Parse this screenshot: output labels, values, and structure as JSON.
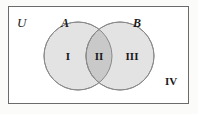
{
  "figure": {
    "type": "venn-diagram",
    "sets": 2,
    "background_color": "#fbfbfa",
    "universe": {
      "label": "U",
      "border_color": "#6b6b6b",
      "fill_color": "#ffffff"
    },
    "circles": [
      {
        "label": "A",
        "name": "set-a",
        "fill_color": "#e3e3e3",
        "stroke_color": "#8a8a8a"
      },
      {
        "label": "B",
        "name": "set-b",
        "fill_color": "#e3e3e3",
        "stroke_color": "#8a8a8a"
      }
    ],
    "intersection": {
      "fill_color": "#c9c9c9",
      "stroke_color": "#8a8a8a"
    },
    "regions": [
      {
        "label": "I",
        "name": "region-a-only",
        "description": "A only"
      },
      {
        "label": "II",
        "name": "region-intersection",
        "description": "A and B"
      },
      {
        "label": "III",
        "name": "region-b-only",
        "description": "B only"
      },
      {
        "label": "IV",
        "name": "region-outside",
        "description": "outside A and B"
      }
    ]
  }
}
